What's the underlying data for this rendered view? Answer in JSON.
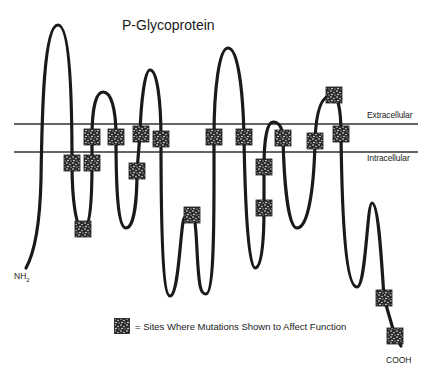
{
  "diagram": {
    "title": "P-Glycoprotein",
    "regions": {
      "extracellular": "Extracellular",
      "intracellular": "Intracellular"
    },
    "termini": {
      "n_terminus": "NH",
      "n_terminus_sub": "2",
      "c_terminus": "COOH"
    },
    "legend": {
      "symbol": "mutation-site-square",
      "text": "= Sites Where Mutations Shown to Affect Function"
    },
    "colors": {
      "line": "#1a1a1a",
      "membrane": "#333333",
      "background": "#ffffff"
    },
    "membrane": {
      "outer_y": 124,
      "inner_y": 152,
      "x_start": 14,
      "x_end": 418
    },
    "transmembrane_segments": 12,
    "mutation_sites": [
      {
        "x": 72,
        "y": 163
      },
      {
        "x": 92,
        "y": 137
      },
      {
        "x": 92,
        "y": 163
      },
      {
        "x": 83,
        "y": 229
      },
      {
        "x": 116,
        "y": 137
      },
      {
        "x": 141,
        "y": 134
      },
      {
        "x": 137,
        "y": 171
      },
      {
        "x": 161,
        "y": 139
      },
      {
        "x": 192,
        "y": 215
      },
      {
        "x": 214,
        "y": 137
      },
      {
        "x": 244,
        "y": 137
      },
      {
        "x": 264,
        "y": 167
      },
      {
        "x": 264,
        "y": 208
      },
      {
        "x": 283,
        "y": 138
      },
      {
        "x": 315,
        "y": 141
      },
      {
        "x": 334,
        "y": 95
      },
      {
        "x": 341,
        "y": 134
      },
      {
        "x": 384,
        "y": 298
      },
      {
        "x": 395,
        "y": 336
      }
    ]
  }
}
